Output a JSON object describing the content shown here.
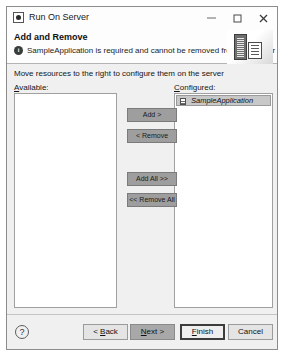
{
  "window": {
    "title": "Run On Server",
    "app_icon": "server-app-icon",
    "controls": {
      "minimize": "minimize-icon",
      "maximize": "maximize-icon",
      "close": "close-icon"
    }
  },
  "header": {
    "title": "Add and Remove",
    "status_icon": "info-icon",
    "message": "SampleApplication is required and cannot be removed from the server",
    "banner_icon": "server-rack-icon"
  },
  "body": {
    "instruction": "Move resources to the right to configure them on the server",
    "available": {
      "label": "Available:",
      "mnemonic": "A",
      "items": []
    },
    "configured": {
      "label": "Configured:",
      "mnemonic": "C",
      "items": [
        {
          "name": "SampleApplication",
          "icon": "application-file-icon",
          "selected": true,
          "italic": true
        }
      ]
    },
    "transfer_buttons": [
      {
        "id": "add",
        "label": "Add >"
      },
      {
        "id": "remove",
        "label": "< Remove"
      },
      {
        "id": "add-all",
        "label": "Add All >>"
      },
      {
        "id": "remove-all",
        "label": "<< Remove All"
      }
    ]
  },
  "footer": {
    "help_label": "?",
    "back_label": "< Back",
    "next_label": "Next >",
    "finish_label": "Finish",
    "cancel_label": "Cancel"
  },
  "colors": {
    "dialog_bg": "#f0f0f0",
    "titlebar_bg": "#fdfdfd",
    "list_bg": "#ffffff",
    "selection_bg": "#c8c8c8",
    "transfer_button_bg": "#9e9e9e",
    "default_button_border": "#3c3c3c"
  }
}
